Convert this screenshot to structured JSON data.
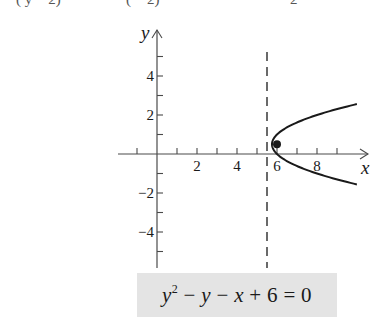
{
  "top_fragment": {
    "parts": [
      {
        "text": "(  y  −  2)",
        "x": 16
      },
      {
        "text": "(   −  2)",
        "x": 126
      },
      {
        "text": "2",
        "x": 290
      }
    ]
  },
  "equation_box": {
    "lhs_var": "y",
    "lhs_exp": "2",
    "rest_1": " − ",
    "var_y": "y",
    "rest_2": " − ",
    "var_x": "x",
    "rest_3": " + 6 = 0"
  },
  "chart_data": {
    "type": "line",
    "title": "",
    "equation": "y^2 - y - x + 6 = 0",
    "xlabel": "x",
    "ylabel": "y",
    "xlim": [
      -2,
      10.5
    ],
    "ylim": [
      -5.9,
      6.4
    ],
    "x_ticks": [
      -1,
      1,
      2,
      3,
      4,
      5,
      6,
      7,
      8,
      9
    ],
    "x_tick_labels": [
      {
        "value": 2,
        "label": "2"
      },
      {
        "value": 4,
        "label": "4"
      },
      {
        "value": 6,
        "label": "6"
      },
      {
        "value": 8,
        "label": "8"
      }
    ],
    "y_ticks": [
      -5,
      -4,
      -3,
      -2,
      -1,
      1,
      2,
      3,
      4,
      5
    ],
    "y_tick_labels": [
      {
        "value": 4,
        "label": "4"
      },
      {
        "value": 2,
        "label": "2"
      },
      {
        "value": -2,
        "label": "−2"
      },
      {
        "value": -4,
        "label": "−4"
      }
    ],
    "grid": false,
    "series": [
      {
        "name": "parabola",
        "form": "x = y^2 - y + 6",
        "coefficients": {
          "a": 1,
          "b": -1,
          "c": 6
        },
        "y_range": [
          -1.56,
          2.56
        ],
        "points": [
          [
            9.99,
            -1.56
          ],
          [
            8.64,
            -1.2
          ],
          [
            7.44,
            -0.8
          ],
          [
            6.56,
            -0.4
          ],
          [
            6.0,
            0.0
          ],
          [
            5.81,
            0.25
          ],
          [
            5.75,
            0.5
          ],
          [
            5.81,
            0.75
          ],
          [
            6.0,
            1.0
          ],
          [
            6.56,
            1.4
          ],
          [
            7.44,
            1.8
          ],
          [
            8.64,
            2.2
          ],
          [
            9.99,
            2.56
          ]
        ]
      }
    ],
    "focus": {
      "x": 6,
      "y": 0.5
    },
    "directrix": {
      "x": 5.5,
      "style": "dashed"
    },
    "legend": null
  },
  "layout": {
    "origin_px": [
      157,
      154
    ],
    "x_unit_px": 20,
    "y_unit_px": 19.5,
    "x_axis_px": [
      118,
      368
    ],
    "y_axis_px": [
      30,
      268
    ],
    "directrix_px_y": [
      52,
      268
    ],
    "colors": {
      "ink": "#1a1a1a",
      "axis": "#4a4a4a",
      "box": "#e4e4e4"
    }
  }
}
